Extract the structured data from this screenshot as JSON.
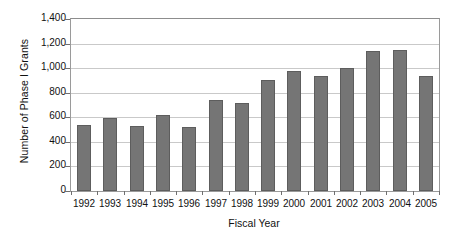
{
  "chart_data": {
    "type": "bar",
    "title": "",
    "xlabel": "Fiscal Year",
    "ylabel": "Number of Phase I Grants",
    "categories": [
      "1992",
      "1993",
      "1994",
      "1995",
      "1996",
      "1997",
      "1998",
      "1999",
      "2000",
      "2001",
      "2002",
      "2003",
      "2004",
      "2005"
    ],
    "values": [
      540,
      595,
      530,
      620,
      520,
      740,
      715,
      905,
      980,
      935,
      1000,
      1140,
      1150,
      935
    ],
    "ylim": [
      0,
      1400
    ],
    "ytick_values": [
      0,
      200,
      400,
      600,
      800,
      1000,
      1200,
      1400
    ],
    "ytick_labels": [
      "0",
      "200",
      "400",
      "600",
      "800",
      "1,000",
      "1,200",
      "1,400"
    ],
    "grid": true,
    "grid_axis": "y",
    "legend": false,
    "legend_position": "none",
    "series": [
      {
        "name": "Phase I Grants",
        "values": [
          540,
          595,
          530,
          620,
          520,
          740,
          715,
          905,
          980,
          935,
          1000,
          1140,
          1150,
          935
        ],
        "color": "#757575"
      }
    ],
    "colors": {
      "bar_fill": "#757575",
      "bar_border": "#5d5d5d",
      "gridline": "#c9c9c9",
      "axis": "#9a9a9a",
      "text": "#111111",
      "background": "#ffffff"
    }
  }
}
